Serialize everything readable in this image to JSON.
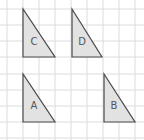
{
  "diagram": {
    "type": "grid-with-triangles",
    "grid": {
      "spacing": 16,
      "offset_x": 7,
      "offset_y": 9,
      "color": "#dcdcdc"
    },
    "triangles": [
      {
        "label": "C",
        "points": "23,9 23,57 55,57",
        "label_x": 34,
        "label_y": 42
      },
      {
        "label": "D",
        "points": "72,9 72,57 102,57",
        "label_x": 82,
        "label_y": 42
      },
      {
        "label": "A",
        "points": "23,74 23,122 55,122",
        "label_x": 34,
        "label_y": 106
      },
      {
        "label": "B",
        "points": "104,74 104,122 135,122",
        "label_x": 114,
        "label_y": 106
      }
    ],
    "fill_color": "#e2e2e2",
    "stroke_color": "#4a4a4a"
  }
}
